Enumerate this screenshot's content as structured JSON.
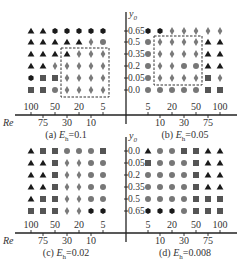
{
  "chart_data": [
    {
      "type": "scatter",
      "panel": "a",
      "title": "(a) E_h=0.1",
      "caption_prefix": "(a) ",
      "caption_var": "E",
      "caption_sub": "h",
      "caption_value": "=0.1",
      "xlabel": "Re",
      "ylabel": "y0",
      "x_categories": [
        "100",
        "75",
        "50",
        "30",
        "20",
        "10",
        "5"
      ],
      "y_categories": [
        "0.65",
        "0.5",
        "0.35",
        "0.2",
        "0.05",
        "0.0"
      ],
      "grid": [
        [
          "triangle",
          "triangle",
          "hexagon",
          "hexagon",
          "hexagon",
          "hexagon",
          "hexagon"
        ],
        [
          "triangle",
          "triangle",
          "triangle",
          "triangle",
          "triangle",
          "diamond",
          "circle"
        ],
        [
          "triangle",
          "triangle",
          "triangle",
          "triangle",
          "diamond",
          "diamond",
          "diamond"
        ],
        [
          "triangle",
          "triangle",
          "diamond",
          "diamond",
          "diamond",
          "diamond",
          "diamond"
        ],
        [
          "hexagon",
          "square",
          "square",
          "diamond",
          "diamond",
          "diamond",
          "diamond"
        ],
        [
          "square",
          "square",
          "circle",
          "diamond",
          "diamond",
          "diamond",
          "diamond"
        ]
      ],
      "dashed_box": {
        "x_from": "30",
        "x_to": "5",
        "y_from": "0.35",
        "y_to": "0.0"
      }
    },
    {
      "type": "scatter",
      "panel": "b",
      "title": "(b) E_h=0.05",
      "caption_prefix": "(b) ",
      "caption_var": "E",
      "caption_sub": "h",
      "caption_value": "=0.05",
      "xlabel": "Re",
      "ylabel": "y0",
      "x_categories": [
        "5",
        "10",
        "20",
        "30",
        "50",
        "75",
        "100"
      ],
      "y_categories": [
        "0.65",
        "0.5",
        "0.35",
        "0.2",
        "0.05",
        "0.0"
      ],
      "grid": [
        [
          "hexagon",
          "hexagon",
          "diamond",
          "diamond",
          "diamond",
          "diamond",
          "diamond"
        ],
        [
          "circle",
          "diamond",
          "diamond",
          "diamond",
          "diamond",
          "triangle",
          "triangle"
        ],
        [
          "circle",
          "diamond",
          "diamond",
          "diamond",
          "diamond",
          "triangle",
          "triangle"
        ],
        [
          "circle",
          "diamond",
          "diamond",
          "circle",
          "circle",
          "triangle",
          "triangle"
        ],
        [
          "circle",
          "diamond",
          "diamond",
          "diamond",
          "diamond",
          "square",
          "diamond"
        ],
        [
          "circle",
          "circle",
          "circle",
          "circle",
          "circle",
          "square",
          "square"
        ]
      ],
      "dashed_box": {
        "x_from": "10",
        "x_to": "50",
        "y_from": "0.5",
        "y_to": "0.05"
      }
    },
    {
      "type": "scatter",
      "panel": "c",
      "title": "(c) E_h=0.02",
      "caption_prefix": "(c) ",
      "caption_var": "E",
      "caption_sub": "h",
      "caption_value": "=0.02",
      "xlabel": "Re",
      "ylabel": "y0",
      "x_categories": [
        "100",
        "75",
        "50",
        "30",
        "20",
        "10",
        "5"
      ],
      "y_categories": [
        "0.0",
        "0.05",
        "0.2",
        "0.35",
        "0.5",
        "0.65"
      ],
      "grid": [
        [
          "triangle",
          "square",
          "square",
          "circle",
          "circle",
          "circle",
          "square"
        ],
        [
          "triangle",
          "triangle",
          "square",
          "diamond",
          "diamond",
          "circle",
          "circle"
        ],
        [
          "triangle",
          "triangle",
          "square",
          "diamond",
          "diamond",
          "circle",
          "circle"
        ],
        [
          "triangle",
          "triangle",
          "square",
          "diamond",
          "diamond",
          "circle",
          "circle"
        ],
        [
          "triangle",
          "square",
          "square",
          "diamond",
          "diamond",
          "circle",
          "circle"
        ],
        [
          "square",
          "square",
          "square",
          "diamond",
          "diamond",
          "hexagon",
          "hexagon"
        ]
      ]
    },
    {
      "type": "scatter",
      "panel": "d",
      "title": "(d) E_h=0.008",
      "caption_prefix": "(d) ",
      "caption_var": "E",
      "caption_sub": "h",
      "caption_value": "=0.008",
      "xlabel": "Re",
      "ylabel": "y0",
      "x_categories": [
        "5",
        "10",
        "20",
        "30",
        "50",
        "75",
        "100"
      ],
      "y_categories": [
        "0.0",
        "0.05",
        "0.2",
        "0.35",
        "0.5",
        "0.65"
      ],
      "grid": [
        [
          "triangle",
          "circle",
          "circle",
          "square",
          "square",
          "triangle",
          "triangle"
        ],
        [
          "square",
          "circle",
          "circle",
          "circle",
          "square",
          "triangle",
          "triangle"
        ],
        [
          "circle",
          "circle",
          "circle",
          "circle",
          "square",
          "triangle",
          "triangle"
        ],
        [
          "circle",
          "circle",
          "circle",
          "circle",
          "square",
          "triangle",
          "triangle"
        ],
        [
          "circle",
          "circle",
          "circle",
          "circle",
          "square",
          "square",
          "square"
        ],
        [
          "hexagon",
          "hexagon",
          "hexagon",
          "circle",
          "square",
          "square",
          "square"
        ]
      ]
    }
  ],
  "axes": {
    "x_name": "Re",
    "y_name_var": "y",
    "y_name_sub": "0",
    "top_row_ticks_left": [
      "100",
      "50",
      "20",
      "5"
    ],
    "bottom_row_ticks_left": [
      "75",
      "30",
      "10"
    ],
    "top_row_ticks_right": [
      "5",
      "20",
      "50",
      "100"
    ],
    "bottom_row_ticks_right": [
      "10",
      "30",
      "75"
    ]
  },
  "colors": {
    "triangle": "#1a1a1a",
    "hexagon": "#1a1a1a",
    "square": "#555555",
    "circle": "#777777",
    "diamond": "#7a7a7a",
    "axis": "#222222",
    "dash": "#333333"
  }
}
